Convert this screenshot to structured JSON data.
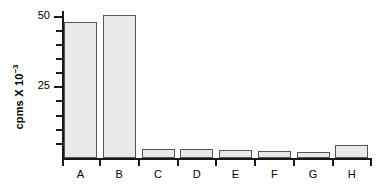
{
  "chart_data": {
    "type": "bar",
    "title": "",
    "xlabel": "",
    "ylabel": "cpms X 10",
    "ylabel_exponent": "−3",
    "categories": [
      "A",
      "B",
      "C",
      "D",
      "E",
      "F",
      "G",
      "H"
    ],
    "values": [
      48,
      50.5,
      3.1,
      3.3,
      2.8,
      2.4,
      2.1,
      4.5
    ],
    "ylim": [
      0,
      52
    ],
    "y_tick_labels": [
      "25",
      "50"
    ],
    "y_major_ticks": [
      25,
      50
    ],
    "y_minor_ticks": [
      5,
      10,
      15,
      20,
      30,
      35,
      40,
      45
    ],
    "grid": false,
    "legend": null,
    "bar_fill_color": "#e9e9e9",
    "bar_edge_color": "#555555",
    "axis_color": "#1a1a1a",
    "background_color": "#ffffff"
  },
  "axis": {
    "y_title_text": "cpms X 10",
    "y_title_sup": "−3",
    "tick_50": "50",
    "tick_25": "25"
  },
  "bars": [
    {
      "label": "A",
      "value": 48
    },
    {
      "label": "B",
      "value": 50.5
    },
    {
      "label": "C",
      "value": 3.1
    },
    {
      "label": "D",
      "value": 3.3
    },
    {
      "label": "E",
      "value": 2.8
    },
    {
      "label": "F",
      "value": 2.4
    },
    {
      "label": "G",
      "value": 2.1
    },
    {
      "label": "H",
      "value": 4.5
    }
  ]
}
